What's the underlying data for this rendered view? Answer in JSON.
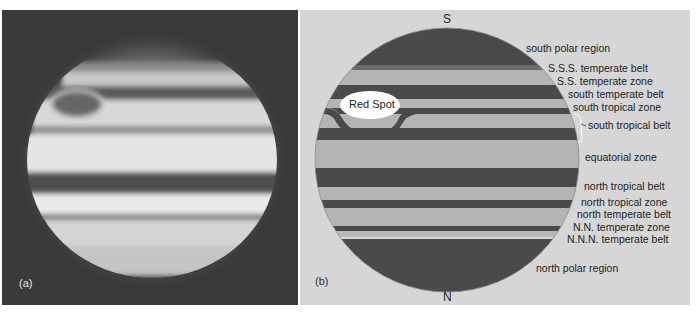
{
  "figure": {
    "panel_a": {
      "label": "(a)",
      "description": "Photograph of Jupiter showing bands and Great Red Spot"
    },
    "panel_b": {
      "label": "(b)",
      "pole_top": "S",
      "pole_bottom": "N",
      "red_spot_label": "Red Spot",
      "labels": [
        "south polar region",
        "S.S.S. temperate belt",
        "S.S. temperate zone",
        "south temperate belt",
        "south tropical zone",
        "south tropical belt",
        "equatorial zone",
        "north tropical belt",
        "north tropical zone",
        "north temperate belt",
        "N.N. temperate zone",
        "N.N.N. temperate belt",
        "north polar region"
      ]
    },
    "colors": {
      "panel_a_bg": "#3a3a3a",
      "panel_b_bg": "#d6d6d6",
      "belt_dark": "#4a4a4a",
      "zone_light": "#b4b4b4",
      "red_spot_fill": "#ffffff"
    }
  }
}
